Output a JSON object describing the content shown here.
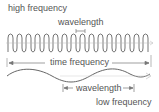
{
  "labels": {
    "high_frequency": "high frequency",
    "wavelength_top": "wavelength",
    "time_frequency": "time frequency",
    "wavelength_bottom": "wavelength",
    "low_frequency": "low frequency"
  },
  "colors": {
    "wave": "#666666",
    "arrow": "#777777",
    "text": "#555555"
  },
  "waves": {
    "high_frequency_cycles": 16,
    "low_frequency_cycles": 1.5
  }
}
